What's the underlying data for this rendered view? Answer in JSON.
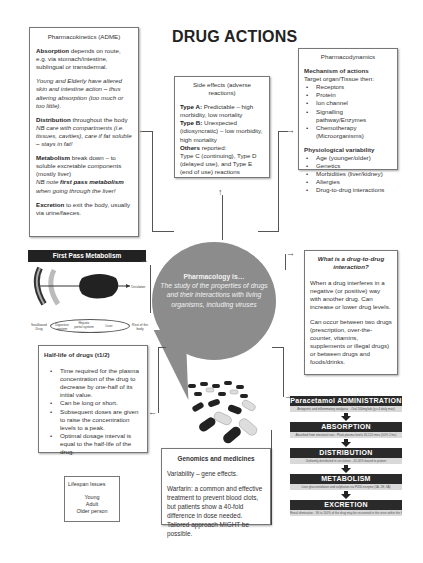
{
  "title": "DRUG ACTIONS",
  "pharmacokinetics": {
    "heading": "Pharmacokinetics (ADME)",
    "absorption_label": "Absorption",
    "absorption_text": " depends on route, e.g. via stomach/intestine, sublingual or transdermal.",
    "absorption_note": "Young and Elderly have altered skin and intestine action – thus altering absorption (too much or too little).",
    "distribution_label": "Distribution",
    "distribution_text": " throughout the body",
    "distribution_note": "NB care with compartments (i.e. tissues, cavities), care if fat soluble – stays in fat!",
    "metabolism_label": "Metabolism",
    "metabolism_text": " break down – to soluble excretable components (mostly liver)",
    "metabolism_note_pre": "NB note ",
    "metabolism_note_bold": "first pass metabolism",
    "metabolism_note_post": " when going through the liver!",
    "excretion_label": "Excretion",
    "excretion_text": " to exit the body, usually via urine/faeces."
  },
  "side_effects": {
    "heading": "Side effects (adverse reactions)",
    "type_a_label": "Type A:",
    "type_a_text": " Predictable – high morbidity, low mortality",
    "type_b_label": "Type B:",
    "type_b_text": " Unexpected (idiosyncratic) – low morbidity, high mortality",
    "others_label": "Others",
    "others_text": " reported:",
    "others_detail": "Type C (continuing), Type D (delayed use), and Type E (end of use) reactions"
  },
  "pharmacodynamics": {
    "heading": "Pharmacodynamics",
    "mechanism_heading": "Mechanism of actions",
    "mechanism_intro": "Target organ/Tissue then:",
    "mechanism_items": [
      "Receptors",
      "Protein",
      "Ion channel",
      "Signalling pathway/Enzymes",
      "Chemotherapy (Microorganisms)"
    ],
    "variability_heading": "Physiological variability",
    "variability_items": [
      "Age (younger/older)",
      "Genetics",
      "Morbidities (liver/kidney)",
      "Allergies",
      "Drug-to-drug interactions"
    ]
  },
  "center_bubble": {
    "heading": "Pharmacology is…",
    "text": "The study of the properties of drugs and their interactions with living organisms, including viruses"
  },
  "first_pass": {
    "heading": "First Pass Metabolism",
    "diagram_labels": [
      "Swallowed Drug",
      "Digestive system",
      "Hepatic portal system",
      "Liver",
      "Rest of the body"
    ]
  },
  "drug_interaction": {
    "heading": "What is a drug-to-drug interaction?",
    "para1": "When a drug interferes in a negative (or positive) way with another drug. Can increase or lower drug levels.",
    "para2": "Can occur between two drugs (prescription, over-the-counter, vitamins, supplements or illegal drugs) or between drugs and foods/drinks."
  },
  "half_life": {
    "heading": "Half-life of drugs (t1/2)",
    "items": [
      "Time required for the plasma concentration of the drug to decrease by one-half of its initial value.",
      "Can be long or short.",
      "Subsequent doses are given to raise the concentration levels to a peak.",
      "Optimal dosage interval is equal to the half-life of the drug."
    ]
  },
  "lifespan": {
    "heading": "Lifespan Issues",
    "items": [
      "Young",
      "Adult",
      "Older person"
    ]
  },
  "genomics": {
    "heading": "Genomics and medicines",
    "para1": "Variability – gene effects.",
    "para2": "Warfarin: a common and effective treatment to prevent blood clots, but patients show a 40-fold difference in dose needed. Tailored approach MIGHT be possible."
  },
  "paracetamol_flow": {
    "steps": [
      {
        "label": "Paracetamol ADMINISTRATION",
        "sub": "Antipyretic and inflammatory analgesic - Oral 500mg/tab (g x 4 daily max)"
      },
      {
        "label": "ABSORPTION",
        "sub": "Absorbed from intestinal tract - Peak plasma levels 30-120 mins (50% 2 hrs)"
      },
      {
        "label": "DISTRIBUTION",
        "sub": "Uniformly distributed in circulation - 20-50% bound to protein"
      },
      {
        "label": "METABOLISM",
        "sub": "Liver glucuronidation and sulphation via P450 enzyme (1A, 2E, 3A)"
      },
      {
        "label": "EXCRETION",
        "sub": "Renal elimination - 90 to 100% of the drug may be recovered in the urine within the first day"
      }
    ]
  },
  "colors": {
    "bubble": "#8c8c8c",
    "dark_bar": "#222222",
    "box_border": "#777777"
  }
}
